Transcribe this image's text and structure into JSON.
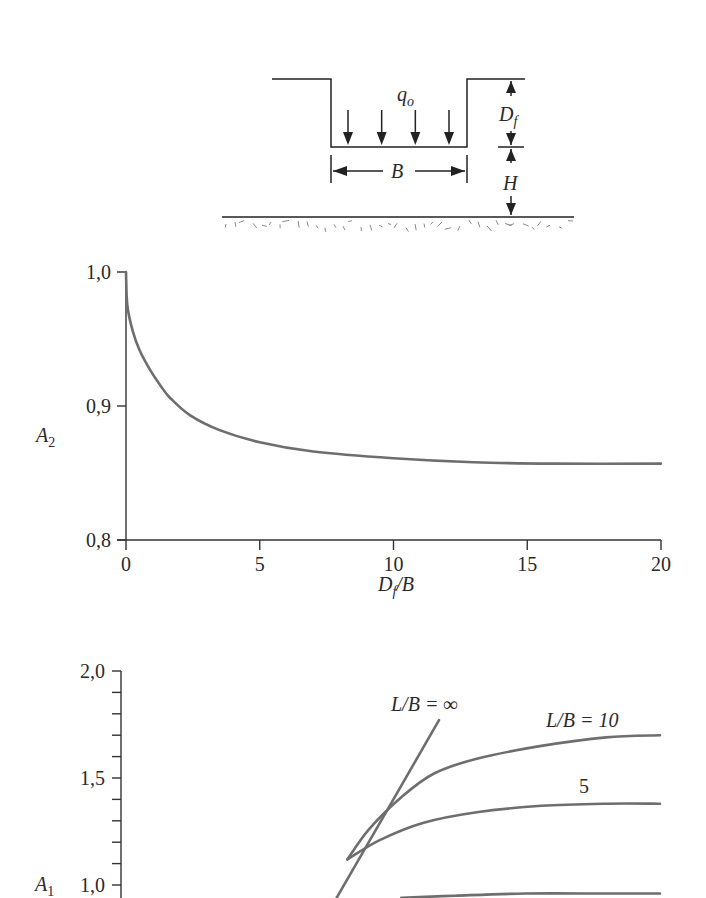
{
  "diagram": {
    "load_label": "q",
    "load_sub": "o",
    "width_label": "B",
    "depth_label": "D",
    "depth_sub": "f",
    "layer_label": "H",
    "load_arrow_count": 4
  },
  "chart_data": [
    {
      "type": "line",
      "title": "",
      "xlabel": "D_f/B",
      "xlabel_main": "D",
      "xlabel_sub": "f",
      "xlabel_tail": "/B",
      "ylabel": "A2",
      "ylabel_main": "A",
      "ylabel_sub": "2",
      "xlim": [
        0,
        20
      ],
      "ylim": [
        0.8,
        1.0
      ],
      "x_ticks": [
        0,
        5,
        10,
        15,
        20
      ],
      "x_tick_labels": [
        "0",
        "5",
        "10",
        "15",
        "20"
      ],
      "y_ticks": [
        0.8,
        0.9,
        1.0
      ],
      "y_tick_labels": [
        "0,8",
        "0,9",
        "1,0"
      ],
      "grid": false,
      "series": [
        {
          "name": "A2",
          "x": [
            0,
            0.05,
            0.25,
            0.5,
            0.9,
            1.3,
            1.65,
            2.4,
            3.5,
            5,
            7,
            10,
            13,
            16,
            20
          ],
          "y": [
            1.0,
            0.975,
            0.956,
            0.942,
            0.927,
            0.915,
            0.906,
            0.893,
            0.882,
            0.873,
            0.866,
            0.861,
            0.858,
            0.857,
            0.857
          ]
        }
      ]
    },
    {
      "type": "line",
      "title": "",
      "xlabel": "",
      "ylabel": "A1",
      "ylabel_main": "A",
      "ylabel_sub": "1",
      "ylim": [
        1.0,
        2.0
      ],
      "y_ticks": [
        1.0,
        1.5,
        2.0
      ],
      "y_tick_labels": [
        "1,0",
        "1,5",
        "2,0"
      ],
      "y_minor_step": 0.1,
      "x_note": "x-axis not visible (cropped); x given as fraction of plot width",
      "grid": false,
      "series": [
        {
          "name": "L/B = ∞",
          "label": "L/B = ∞",
          "x": [
            0.4,
            0.59
          ],
          "y": [
            0.94,
            1.77
          ]
        },
        {
          "name": "L/B = 10",
          "label": "L/B = 10",
          "x": [
            0.42,
            0.46,
            0.52,
            0.58,
            0.66,
            0.78,
            0.9,
            1.0
          ],
          "y": [
            1.12,
            1.26,
            1.41,
            1.52,
            1.59,
            1.65,
            1.69,
            1.7
          ]
        },
        {
          "name": "L/B = 5",
          "label": "5",
          "x": [
            0.42,
            0.48,
            0.56,
            0.66,
            0.78,
            0.9,
            1.0
          ],
          "y": [
            1.12,
            1.21,
            1.29,
            1.34,
            1.37,
            1.38,
            1.38
          ]
        },
        {
          "name": "lower curve (partially cropped)",
          "label": "",
          "x": [
            0.52,
            0.62,
            0.75,
            0.9,
            1.0
          ],
          "y": [
            0.94,
            0.95,
            0.96,
            0.96,
            0.96
          ]
        }
      ]
    }
  ]
}
